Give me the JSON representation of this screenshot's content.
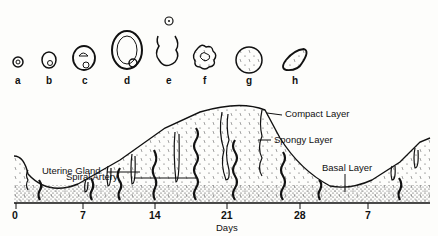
{
  "follicles": [
    {
      "letter": "a"
    },
    {
      "letter": "b"
    },
    {
      "letter": "c"
    },
    {
      "letter": "d"
    },
    {
      "letter": "e"
    },
    {
      "letter": "f"
    },
    {
      "letter": "g"
    },
    {
      "letter": "h"
    }
  ],
  "labels": {
    "compact_layer": "Compact Layer",
    "spiral_artery": "Spiral Artery",
    "spongy_layer": "Spongy Layer",
    "uterine_gland": "Uterine Gland",
    "basal_layer": "Basal Layer"
  },
  "axis": {
    "ticks": [
      "0",
      "7",
      "14",
      "21",
      "28",
      "7"
    ],
    "label": "Days"
  }
}
